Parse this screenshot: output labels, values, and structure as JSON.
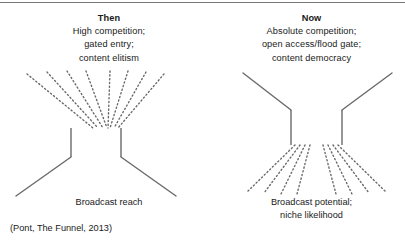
{
  "figure": {
    "source_note": "(Pont, The Funnel, 2013)",
    "line_color": "#6a6a6a",
    "text_color": "#1a1a1a",
    "border_color": "#777777"
  },
  "panels": [
    {
      "id": "then",
      "title": "Then",
      "top_lines": [
        "High competition;",
        "gated entry;",
        "content elitism"
      ],
      "bottom_lines": [
        "Broadcast reach"
      ],
      "funnel": {
        "top_style": "dotted",
        "bottom_style": "solid",
        "top_ray_count": 8,
        "bottom_ray_count": 2
      }
    },
    {
      "id": "now",
      "title": "Now",
      "top_lines": [
        "Absolute competition;",
        "open access/flood gate;",
        "content democracy"
      ],
      "bottom_lines": [
        "Broadcast potential;",
        "niche likelihood"
      ],
      "funnel": {
        "top_style": "solid",
        "bottom_style": "dotted",
        "top_ray_count": 2,
        "bottom_ray_count": 8
      }
    }
  ]
}
